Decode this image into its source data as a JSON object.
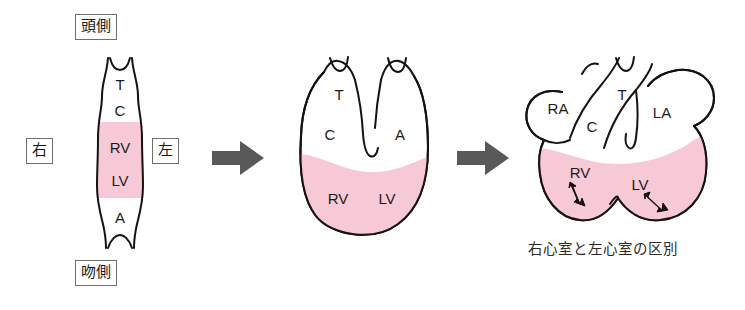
{
  "figure": {
    "title_caption": "右心室と左心室の区別",
    "orientation_labels": {
      "cranial": "頭側",
      "rostral": "吻側",
      "right": "右",
      "left": "左"
    },
    "colors": {
      "ventricle_pink": "#f7c9d7",
      "outline_black": "#17120f",
      "flow_arrow_gray": "#595959",
      "background": "#ffffff",
      "label_text": "#1b1b1b"
    },
    "stages": [
      {
        "name": "straight-heart-tube",
        "segment_labels": [
          "T",
          "C",
          "RV",
          "LV",
          "A"
        ],
        "pink_segments": [
          "RV",
          "LV"
        ]
      },
      {
        "name": "looped-heart-tube",
        "segment_labels": [
          "T",
          "C",
          "A",
          "RV",
          "LV"
        ],
        "pink_segments": [
          "RV",
          "LV"
        ]
      },
      {
        "name": "chambered-heart",
        "segment_labels": [
          "RA",
          "T",
          "C",
          "LA",
          "RV",
          "LV"
        ],
        "pink_segments": [
          "RV",
          "LV"
        ],
        "inner_arrows": [
          "rv-outflow-arrow",
          "lv-outflow-arrow"
        ]
      }
    ],
    "flow_arrows": [
      {
        "name": "transition-arrow-1"
      },
      {
        "name": "transition-arrow-2"
      }
    ]
  }
}
